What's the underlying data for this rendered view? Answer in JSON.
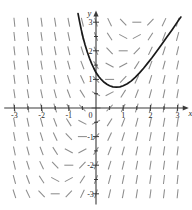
{
  "chart_data": {
    "type": "line",
    "title": "",
    "subtitle": "",
    "xlabel": "x",
    "ylabel": "y",
    "xlim": [
      -3.3,
      3.3
    ],
    "ylim": [
      -3.3,
      3.3
    ],
    "grid": false,
    "legend": null,
    "axis_color": "#3a3a3a",
    "curve_color": "#1a1a1a",
    "field_color": "#8c8c8c",
    "x_ticks": [
      -3,
      -2,
      -1,
      0,
      1,
      2,
      3
    ],
    "y_ticks": [
      -3,
      -2,
      -1,
      1,
      2,
      3
    ],
    "x_tick_labels": [
      "-3",
      "-2",
      "-1",
      "0",
      "1",
      "2",
      "3"
    ],
    "y_tick_labels": [
      "-3",
      "-2",
      "-1",
      "1",
      "2",
      "3"
    ],
    "origin_label": "0",
    "minor_tick_step": 0.5,
    "slope_field": {
      "x_start": -3.0,
      "x_end": 3.0,
      "y_start": -3.0,
      "y_end": 3.0,
      "step": 0.5,
      "segment_length_px": 9,
      "formula": "dy/dx = 2*x - y"
    },
    "series": [
      {
        "name": "solution curve",
        "points": [
          [
            -0.66,
            3.3
          ],
          [
            -0.6,
            3.0
          ],
          [
            -0.54,
            2.73
          ],
          [
            -0.47,
            2.45
          ],
          [
            -0.4,
            2.2
          ],
          [
            -0.32,
            1.96
          ],
          [
            -0.24,
            1.74
          ],
          [
            -0.16,
            1.55
          ],
          [
            -0.08,
            1.39
          ],
          [
            0.0,
            1.24
          ],
          [
            0.1,
            1.1
          ],
          [
            0.2,
            0.99
          ],
          [
            0.3,
            0.9
          ],
          [
            0.4,
            0.83
          ],
          [
            0.5,
            0.78
          ],
          [
            0.62,
            0.74
          ],
          [
            0.75,
            0.73
          ],
          [
            0.88,
            0.74
          ],
          [
            1.0,
            0.78
          ],
          [
            1.15,
            0.85
          ],
          [
            1.3,
            0.95
          ],
          [
            1.45,
            1.08
          ],
          [
            1.6,
            1.23
          ],
          [
            1.75,
            1.39
          ],
          [
            1.9,
            1.57
          ],
          [
            2.05,
            1.75
          ],
          [
            2.2,
            1.94
          ],
          [
            2.4,
            2.2
          ],
          [
            2.6,
            2.47
          ],
          [
            2.8,
            2.74
          ],
          [
            3.0,
            3.02
          ],
          [
            3.12,
            3.18
          ]
        ]
      }
    ]
  }
}
